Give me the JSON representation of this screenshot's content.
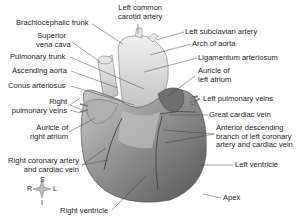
{
  "diagram": {
    "colors": {
      "text": "#222222",
      "leader": "#333333",
      "heart_dark": "#6e6e6e",
      "heart_light": "#d8d8d8"
    },
    "labels": {
      "left_common_carotid": [
        "Left common",
        "carotid artery"
      ],
      "brachiocephalic": "Brachiocephalic trunk",
      "left_subclavian": "Left subclavian artery",
      "superior_vena_cava": [
        "Superior",
        "vena cava"
      ],
      "arch_of_aorta": "Arch of aorta",
      "pulmonary_trunk": "Pulmonary trunk",
      "ligamentum": "Ligamentum arteriosum",
      "ascending_aorta": "Ascending aorta",
      "auricle_left": [
        "Auricle of",
        "left atrium"
      ],
      "conus": "Conus arteriosus",
      "left_pulmonary_veins": "Left pulmonary veins",
      "right_pulmonary_veins": [
        "Right",
        "pulmonary veins"
      ],
      "great_cardiac_vein": "Great cardiac vein",
      "auricle_right": [
        "Auricle of",
        "right atrium"
      ],
      "anterior_descending": [
        "Anterior descending",
        "branch of left coronary",
        "artery and cardiac vein"
      ],
      "right_coronary": [
        "Right coronary artery",
        "and cardiac vein"
      ],
      "left_ventricle": "Left ventricle",
      "apex": "Apex",
      "right_ventricle": "Right ventricle"
    },
    "compass": {
      "S": "S",
      "I": "I",
      "R": "R",
      "L": "L"
    }
  }
}
